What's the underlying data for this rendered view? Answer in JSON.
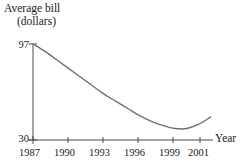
{
  "chart_data": {
    "type": "line",
    "title": "",
    "ylabel": "Average bill (dollars)",
    "ylabel_line1": "Average bill",
    "ylabel_line2": "(dollars)",
    "xlabel": "Year",
    "grid": false,
    "legend": "none",
    "xlim": [
      1987,
      2002.2
    ],
    "ylim": [
      30,
      97
    ],
    "y_tick_labels": [
      "97",
      "30"
    ],
    "y_ticks": [
      97,
      30
    ],
    "x_tick_labels": [
      "1987",
      "1990",
      "1993",
      "1996",
      "1999",
      "2001"
    ],
    "x_ticks": [
      1987,
      1990,
      1993,
      1996,
      1999,
      2001
    ],
    "series": [
      {
        "name": "Average bill",
        "x": [
          1987,
          1988,
          1989,
          1990,
          1991,
          1992,
          1993,
          1994,
          1995,
          1996,
          1997,
          1998,
          1999,
          2000,
          2001,
          2002
        ],
        "values": [
          97,
          92,
          86,
          80,
          74,
          68,
          62,
          57,
          52,
          47,
          43,
          40,
          38,
          38,
          41,
          46
        ]
      }
    ],
    "annotations": [],
    "line_color": "#707070",
    "axis_color": "#4a4a4a"
  }
}
